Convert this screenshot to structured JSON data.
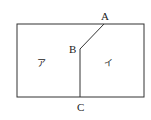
{
  "diagram": {
    "points": {
      "A": {
        "label": "A"
      },
      "B": {
        "label": "B"
      },
      "C": {
        "label": "C"
      }
    },
    "regions": {
      "left": {
        "label": "ア"
      },
      "right": {
        "label": "イ"
      }
    },
    "stroke_color": "#333333"
  }
}
